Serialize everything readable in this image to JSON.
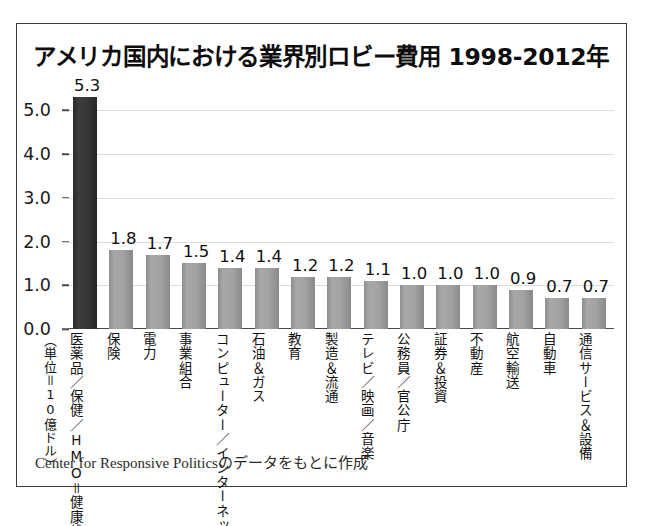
{
  "figure": {
    "title": "アメリカ国内における業界別ロビー費用 1998-2012年",
    "unit_note": "（単位＝10億ドル）",
    "source_note": "Center for Responsive Politicsのデータをもとに作成"
  },
  "chart_data": {
    "type": "bar",
    "title": "アメリカ国内における業界別ロビー費用 1998-2012年",
    "xlabel": "",
    "ylabel": "（単位＝10億ドル）",
    "ylim": [
      0.0,
      5.6
    ],
    "yticks": [
      "0.0",
      "1.0",
      "2.0",
      "3.0",
      "4.0",
      "5.0"
    ],
    "ytick_values": [
      0.0,
      1.0,
      2.0,
      3.0,
      4.0,
      5.0
    ],
    "grid": true,
    "legend": "none",
    "highlight_index": 0,
    "highlight_color": "#2f2f2f",
    "bar_color": "#9e9e9e",
    "categories": [
      "医薬品／保健／HMO＝健康維持機構",
      "保険",
      "電力",
      "事業組合",
      "コンピューター／インターネット",
      "石油＆ガス",
      "教育",
      "製造＆流通",
      "テレビ／映画／音楽",
      "公務員／官公庁",
      "証券＆投資",
      "不動産",
      "航空輸送",
      "自動車",
      "通信サービス＆設備"
    ],
    "values": [
      5.3,
      1.8,
      1.7,
      1.5,
      1.4,
      1.4,
      1.2,
      1.2,
      1.1,
      1.0,
      1.0,
      1.0,
      0.9,
      0.7,
      0.7
    ],
    "value_labels": [
      "5.3",
      "1.8",
      "1.7",
      "1.5",
      "1.4",
      "1.4",
      "1.2",
      "1.2",
      "1.1",
      "1.0",
      "1.0",
      "1.0",
      "0.9",
      "0.7",
      "0.7"
    ]
  }
}
